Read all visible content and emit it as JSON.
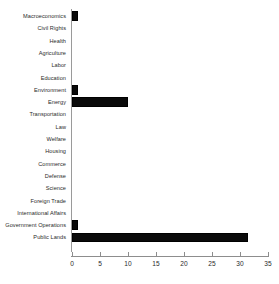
{
  "chart_data": {
    "type": "bar",
    "orientation": "horizontal",
    "title": "",
    "xlabel": "",
    "ylabel": "",
    "xlim": [
      0,
      35
    ],
    "ylim": null,
    "grid": false,
    "legend": null,
    "bar_color": "#000000",
    "axis_color": "#8d8d8d",
    "xticks": [
      0,
      5,
      10,
      15,
      20,
      25,
      30,
      35
    ],
    "xtick_labels": [
      "0",
      "5",
      "10",
      "15",
      "20",
      "25",
      "30",
      "35"
    ],
    "categories": [
      "Macroeconomics",
      "Civil Rights",
      "Health",
      "Agriculture",
      "Labor",
      "Education",
      "Environment",
      "Energy",
      "Transportation",
      "Law",
      "Welfare",
      "Housing",
      "Commerce",
      "Defense",
      "Science",
      "Foreign Trade",
      "International Affairs",
      "Government Operations",
      "Public Lands"
    ],
    "values": [
      1,
      0,
      0,
      0,
      0,
      0,
      1,
      10,
      0,
      0,
      0,
      0,
      0,
      0,
      0,
      0,
      0,
      1,
      31.5
    ]
  }
}
